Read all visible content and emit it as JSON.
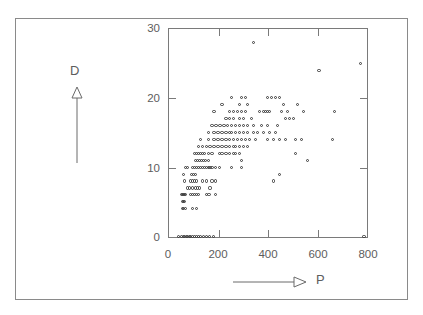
{
  "chart_data": {
    "type": "scatter",
    "title": "",
    "xlabel": "P",
    "ylabel": "D",
    "xlim": [
      0,
      800
    ],
    "ylim": [
      0,
      30
    ],
    "grid": false,
    "legend": null,
    "xticks": [
      0,
      200,
      400,
      600,
      800
    ],
    "yticks": [
      0,
      10,
      20,
      30
    ],
    "xtick_labels": [
      "0",
      "200",
      "400",
      "600",
      "800"
    ],
    "ytick_labels": [
      "0",
      "10",
      "20",
      "30"
    ],
    "marker_style": "open-circle",
    "marker_color": "#3a3a3a",
    "axis_arrow_y": "up-arrow-outline",
    "axis_arrow_x": "right-arrow-outline",
    "points": [
      [
        40,
        0
      ],
      [
        52,
        0
      ],
      [
        60,
        0
      ],
      [
        66,
        0
      ],
      [
        72,
        0
      ],
      [
        78,
        0
      ],
      [
        84,
        0
      ],
      [
        90,
        0
      ],
      [
        96,
        0
      ],
      [
        104,
        0
      ],
      [
        112,
        0
      ],
      [
        120,
        0
      ],
      [
        128,
        0
      ],
      [
        140,
        0
      ],
      [
        152,
        0
      ],
      [
        166,
        0
      ],
      [
        182,
        0
      ],
      [
        790,
        0
      ],
      [
        56,
        4
      ],
      [
        62,
        4
      ],
      [
        68,
        4
      ],
      [
        96,
        4
      ],
      [
        112,
        4
      ],
      [
        56,
        5
      ],
      [
        60,
        5
      ],
      [
        64,
        5
      ],
      [
        54,
        6
      ],
      [
        58,
        6
      ],
      [
        62,
        6
      ],
      [
        66,
        6
      ],
      [
        70,
        6
      ],
      [
        88,
        6
      ],
      [
        96,
        6
      ],
      [
        104,
        6
      ],
      [
        112,
        6
      ],
      [
        120,
        6
      ],
      [
        152,
        6
      ],
      [
        164,
        6
      ],
      [
        190,
        6
      ],
      [
        76,
        7
      ],
      [
        84,
        7
      ],
      [
        96,
        7
      ],
      [
        108,
        7
      ],
      [
        116,
        7
      ],
      [
        124,
        7
      ],
      [
        168,
        7
      ],
      [
        64,
        8
      ],
      [
        88,
        8
      ],
      [
        96,
        8
      ],
      [
        104,
        8
      ],
      [
        112,
        8
      ],
      [
        136,
        8
      ],
      [
        152,
        8
      ],
      [
        176,
        8
      ],
      [
        190,
        8
      ],
      [
        424,
        8
      ],
      [
        60,
        9
      ],
      [
        92,
        9
      ],
      [
        100,
        9
      ],
      [
        108,
        9
      ],
      [
        448,
        9
      ],
      [
        70,
        10
      ],
      [
        78,
        10
      ],
      [
        96,
        10
      ],
      [
        104,
        10
      ],
      [
        112,
        10
      ],
      [
        120,
        10
      ],
      [
        128,
        10
      ],
      [
        136,
        10
      ],
      [
        144,
        10
      ],
      [
        152,
        10
      ],
      [
        160,
        10
      ],
      [
        168,
        10
      ],
      [
        176,
        10
      ],
      [
        190,
        10
      ],
      [
        205,
        10
      ],
      [
        256,
        10
      ],
      [
        296,
        10
      ],
      [
        108,
        11
      ],
      [
        116,
        11
      ],
      [
        124,
        11
      ],
      [
        132,
        11
      ],
      [
        140,
        11
      ],
      [
        148,
        11
      ],
      [
        160,
        11
      ],
      [
        296,
        11
      ],
      [
        560,
        11
      ],
      [
        104,
        12
      ],
      [
        112,
        12
      ],
      [
        120,
        12
      ],
      [
        128,
        12
      ],
      [
        136,
        12
      ],
      [
        144,
        12
      ],
      [
        160,
        12
      ],
      [
        176,
        12
      ],
      [
        205,
        12
      ],
      [
        216,
        12
      ],
      [
        232,
        12
      ],
      [
        248,
        12
      ],
      [
        264,
        12
      ],
      [
        272,
        12
      ],
      [
        288,
        12
      ],
      [
        512,
        12
      ],
      [
        120,
        13
      ],
      [
        136,
        13
      ],
      [
        152,
        13
      ],
      [
        168,
        13
      ],
      [
        184,
        13
      ],
      [
        200,
        13
      ],
      [
        216,
        13
      ],
      [
        232,
        13
      ],
      [
        248,
        13
      ],
      [
        264,
        13
      ],
      [
        272,
        13
      ],
      [
        288,
        13
      ],
      [
        304,
        13
      ],
      [
        320,
        13
      ],
      [
        128,
        14
      ],
      [
        160,
        14
      ],
      [
        184,
        14
      ],
      [
        200,
        14
      ],
      [
        216,
        14
      ],
      [
        232,
        14
      ],
      [
        248,
        14
      ],
      [
        264,
        14
      ],
      [
        280,
        14
      ],
      [
        296,
        14
      ],
      [
        312,
        14
      ],
      [
        328,
        14
      ],
      [
        352,
        14
      ],
      [
        400,
        14
      ],
      [
        424,
        14
      ],
      [
        448,
        14
      ],
      [
        472,
        14
      ],
      [
        512,
        14
      ],
      [
        536,
        14
      ],
      [
        664,
        14
      ],
      [
        160,
        15
      ],
      [
        184,
        15
      ],
      [
        200,
        15
      ],
      [
        216,
        15
      ],
      [
        232,
        15
      ],
      [
        248,
        15
      ],
      [
        256,
        15
      ],
      [
        272,
        15
      ],
      [
        288,
        15
      ],
      [
        304,
        15
      ],
      [
        320,
        15
      ],
      [
        344,
        15
      ],
      [
        360,
        15
      ],
      [
        384,
        15
      ],
      [
        408,
        15
      ],
      [
        432,
        15
      ],
      [
        176,
        16
      ],
      [
        192,
        16
      ],
      [
        208,
        16
      ],
      [
        224,
        16
      ],
      [
        240,
        16
      ],
      [
        256,
        16
      ],
      [
        272,
        16
      ],
      [
        288,
        16
      ],
      [
        304,
        16
      ],
      [
        320,
        16
      ],
      [
        344,
        16
      ],
      [
        376,
        16
      ],
      [
        400,
        16
      ],
      [
        440,
        16
      ],
      [
        232,
        17
      ],
      [
        248,
        17
      ],
      [
        264,
        17
      ],
      [
        288,
        17
      ],
      [
        304,
        17
      ],
      [
        336,
        17
      ],
      [
        472,
        17
      ],
      [
        488,
        17
      ],
      [
        504,
        17
      ],
      [
        184,
        18
      ],
      [
        248,
        18
      ],
      [
        264,
        18
      ],
      [
        280,
        18
      ],
      [
        296,
        18
      ],
      [
        312,
        18
      ],
      [
        368,
        18
      ],
      [
        384,
        18
      ],
      [
        392,
        18
      ],
      [
        400,
        18
      ],
      [
        408,
        18
      ],
      [
        456,
        18
      ],
      [
        480,
        18
      ],
      [
        544,
        18
      ],
      [
        672,
        18
      ],
      [
        216,
        19
      ],
      [
        288,
        19
      ],
      [
        320,
        19
      ],
      [
        464,
        19
      ],
      [
        520,
        19
      ],
      [
        256,
        20
      ],
      [
        296,
        20
      ],
      [
        312,
        20
      ],
      [
        400,
        20
      ],
      [
        416,
        20
      ],
      [
        432,
        20
      ],
      [
        448,
        20
      ],
      [
        608,
        24
      ],
      [
        776,
        25
      ],
      [
        344,
        28
      ]
    ]
  }
}
